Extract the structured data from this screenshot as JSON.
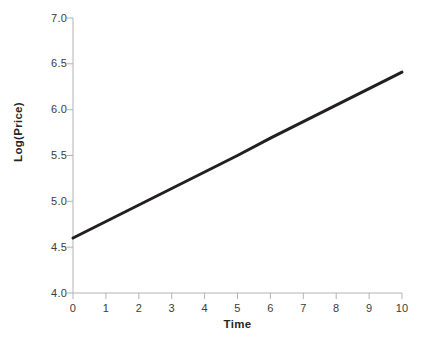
{
  "chart_data": {
    "type": "line",
    "title": "",
    "subtitle": "",
    "xlabel": "Time",
    "ylabel": "Log(Price)",
    "xlim": [
      0,
      10
    ],
    "ylim": [
      4.0,
      7.0
    ],
    "xticks": [
      0,
      1,
      2,
      3,
      4,
      5,
      6,
      7,
      8,
      9,
      10
    ],
    "xtick_labels": [
      "0",
      "1",
      "2",
      "3",
      "4",
      "5",
      "6",
      "7",
      "8",
      "9",
      "10"
    ],
    "yticks": [
      4.0,
      4.5,
      5.0,
      5.5,
      6.0,
      6.5,
      7.0
    ],
    "ytick_labels": [
      "4.0",
      "4.5",
      "5.0",
      "5.5",
      "6.0",
      "6.5",
      "7.0"
    ],
    "grid": false,
    "legend": false,
    "legend_position": "none",
    "series": [
      {
        "name": "Log(Price)",
        "color": "#231f20",
        "line_width": 3,
        "x": [
          0,
          1,
          2,
          3,
          4,
          5,
          6,
          7,
          8,
          9,
          10
        ],
        "values": [
          4.6,
          4.78,
          4.96,
          5.14,
          5.32,
          5.5,
          5.69,
          5.87,
          6.05,
          6.23,
          6.41
        ]
      }
    ],
    "annotations": []
  },
  "style": {
    "background": "#ffffff",
    "axis_color": "#b3b3b3",
    "tick_text_color": "#3b3b3b",
    "axis_label_color": "#262626",
    "line_color": "#231f20"
  }
}
